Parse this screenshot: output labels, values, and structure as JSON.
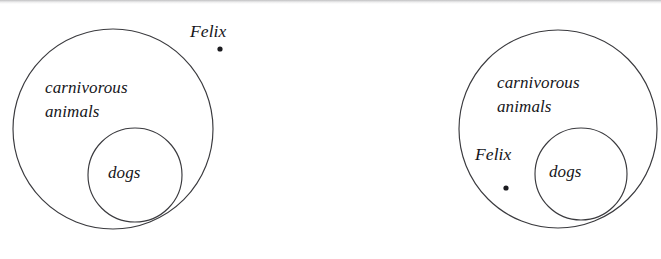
{
  "figure": {
    "type": "euler-set-diagram",
    "background_color": "#ffffff",
    "stroke_color": "#3a3a3e",
    "text_color": "#16161a",
    "panel_count": 2
  },
  "panels": [
    {
      "id": "left",
      "name": "felix-outside-carnivorous-animals",
      "outer_set_label": "carnivorous\nanimals",
      "outer_set_label_line1": "carnivorous",
      "outer_set_label_line2": "animals",
      "inner_set_label": "dogs",
      "individual_label": "Felix",
      "individual_position": "outside-outer-circle",
      "outer_circle": {
        "cx": 113,
        "cy": 129,
        "r": 100
      },
      "inner_circle": {
        "cx": 135,
        "cy": 175,
        "r": 47
      },
      "individual_dot": {
        "cx": 220,
        "cy": 49,
        "r": 2.6
      }
    },
    {
      "id": "right",
      "name": "felix-inside-carnivorous-animals",
      "outer_set_label": "carnivorous\nanimals",
      "outer_set_label_line1": "carnivorous",
      "outer_set_label_line2": "animals",
      "inner_set_label": "dogs",
      "individual_label": "Felix",
      "individual_position": "inside-outer-circle-outside-inner-circle",
      "outer_circle": {
        "cx": 558,
        "cy": 129,
        "r": 99
      },
      "inner_circle": {
        "cx": 581,
        "cy": 174,
        "r": 46
      },
      "individual_dot": {
        "cx": 506,
        "cy": 188,
        "r": 2.6
      }
    }
  ]
}
